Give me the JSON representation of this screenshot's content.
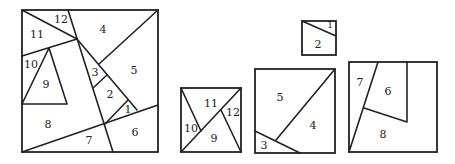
{
  "colors": {
    "stroke": "#222222",
    "background": "#ffffff"
  },
  "figures": {
    "main_square": {
      "description": "Large square dissected into 12 numbered pieces",
      "labels": {
        "p1": "1",
        "p2": "2",
        "p3": "3",
        "p4": "4",
        "p5": "5",
        "p6": "6",
        "p7": "7",
        "p8": "8",
        "p9": "9",
        "p10": "10",
        "p11": "11",
        "p12": "12"
      }
    },
    "square_9_12": {
      "description": "Square assembled from pieces 9, 10, 11, 12",
      "labels": {
        "p9": "9",
        "p10": "10",
        "p11": "11",
        "p12": "12"
      }
    },
    "square_3_5": {
      "description": "Square assembled from pieces 3, 4, 5",
      "labels": {
        "p3": "3",
        "p4": "4",
        "p5": "5"
      }
    },
    "square_1_2": {
      "description": "Small square assembled from pieces 1, 2",
      "labels": {
        "p1": "1",
        "p2": "2"
      }
    },
    "square_6_8": {
      "description": "Square assembled from pieces 6, 7, 8",
      "labels": {
        "p6": "6",
        "p7": "7",
        "p8": "8"
      }
    }
  }
}
